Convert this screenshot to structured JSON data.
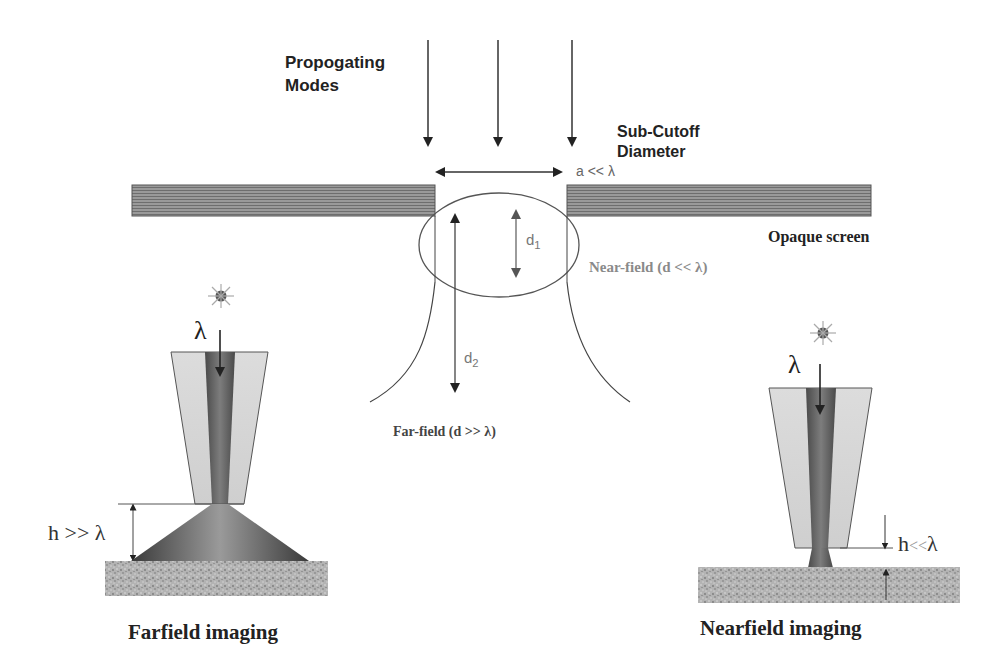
{
  "labels": {
    "propagating_modes_line1": "Propogating",
    "propagating_modes_line2": "Modes",
    "sub_cutoff_line1": "Sub-Cutoff",
    "sub_cutoff_line2": "Diameter",
    "aperture": "a << λ",
    "opaque_screen": "Opaque screen",
    "near_field": "Near-field (d << λ)",
    "far_field": "Far-field (d >> λ)",
    "d1_base": "d",
    "d1_sub": "1",
    "d2_base": "d",
    "d2_sub": "2",
    "lambda_left": "λ",
    "lambda_right": "λ",
    "h_far": "h >> λ",
    "h_near_h": "h",
    "h_near_rel": "<<",
    "h_near_lambda": "λ",
    "farfield_caption": "Farfield imaging",
    "nearfield_caption": "Nearfield imaging"
  },
  "colors": {
    "screen_fill": "#8a8a8a",
    "line": "#333333",
    "gray_text": "#666666",
    "cladding": "#d9d9d9",
    "core": "#6f6f6f",
    "sample": "#b0b0b0"
  }
}
